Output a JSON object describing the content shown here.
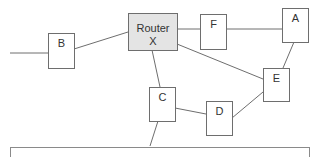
{
  "diagram": {
    "type": "network-topology",
    "nodes": [
      {
        "id": "router",
        "label_line1": "Router",
        "label_line2": "X"
      },
      {
        "id": "A",
        "label": "A"
      },
      {
        "id": "B",
        "label": "B"
      },
      {
        "id": "C",
        "label": "C"
      },
      {
        "id": "D",
        "label": "D"
      },
      {
        "id": "E",
        "label": "E"
      },
      {
        "id": "F",
        "label": "F"
      }
    ],
    "edges": [
      [
        "external-left",
        "B"
      ],
      [
        "B",
        "router"
      ],
      [
        "router",
        "F"
      ],
      [
        "F",
        "A"
      ],
      [
        "router",
        "E"
      ],
      [
        "A",
        "E"
      ],
      [
        "router",
        "C"
      ],
      [
        "C",
        "D"
      ],
      [
        "D",
        "E"
      ],
      [
        "C",
        "external-bottom"
      ]
    ],
    "colors": {
      "router_fill": "#e4e4e4",
      "node_fill": "#ffffff",
      "stroke": "#6e6e6e"
    }
  }
}
